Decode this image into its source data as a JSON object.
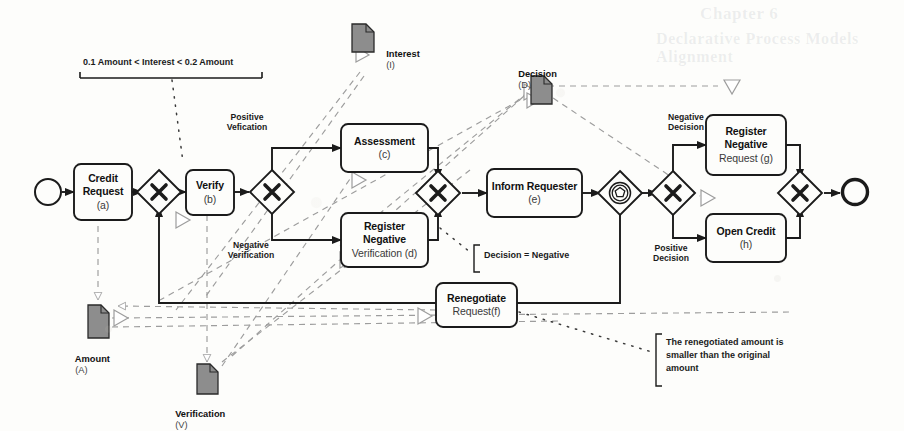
{
  "diagram": {
    "type": "BPMN process model",
    "title_visible": false
  },
  "events": {
    "start": {
      "name": "start-event",
      "shape": "circle-thin"
    },
    "end": {
      "name": "end-event",
      "shape": "circle-thick"
    }
  },
  "gateways": [
    {
      "id": "gw1",
      "symbol": "X",
      "kind": "exclusive",
      "name": "exclusive-gateway-merge-request"
    },
    {
      "id": "gw2",
      "symbol": "X",
      "kind": "exclusive",
      "name": "exclusive-gateway-verification-split"
    },
    {
      "id": "gw3",
      "symbol": "X",
      "kind": "exclusive",
      "name": "exclusive-gateway-verification-merge"
    },
    {
      "id": "gw4",
      "symbol": "O",
      "kind": "event-based",
      "name": "event-based-gateway-decision-wait"
    },
    {
      "id": "gw5",
      "symbol": "X",
      "kind": "exclusive",
      "name": "exclusive-gateway-decision-split"
    },
    {
      "id": "gw6",
      "symbol": "X",
      "kind": "exclusive",
      "name": "exclusive-gateway-final-merge"
    }
  ],
  "tasks": [
    {
      "id": "a",
      "lines": [
        "Credit",
        "Request"
      ],
      "code": "(a)",
      "name": "task-credit-request"
    },
    {
      "id": "b",
      "lines": [
        "Verify"
      ],
      "code": "(b)",
      "name": "task-verify"
    },
    {
      "id": "c",
      "lines": [
        "Assessment"
      ],
      "code": "(c)",
      "name": "task-assessment"
    },
    {
      "id": "d",
      "lines": [
        "Register",
        "Negative"
      ],
      "code": "Verification (d)",
      "name": "task-register-negative-verification"
    },
    {
      "id": "e",
      "lines": [
        "Inform Requester"
      ],
      "code": "(e)",
      "name": "task-inform-requester"
    },
    {
      "id": "f",
      "lines": [
        "Renegotiate"
      ],
      "code": "Request(f)",
      "name": "task-renegotiate-request"
    },
    {
      "id": "g",
      "lines": [
        "Register",
        "Negative"
      ],
      "code": "Request (g)",
      "name": "task-register-negative-request"
    },
    {
      "id": "h",
      "lines": [
        "Open Credit"
      ],
      "code": "(h)",
      "name": "task-open-credit"
    }
  ],
  "data_objects": [
    {
      "id": "I",
      "label": "Interest",
      "code": "(I)",
      "name": "data-object-interest"
    },
    {
      "id": "D",
      "label": "Decision",
      "code": "(D)",
      "name": "data-object-decision"
    },
    {
      "id": "A",
      "label": "Amount",
      "code": "(A)",
      "name": "data-object-amount"
    },
    {
      "id": "V",
      "label": "Verification",
      "code": "(V)",
      "name": "data-object-verification"
    }
  ],
  "flow_labels": [
    {
      "id": "pos-verif",
      "text": "Positive\nVefication",
      "name": "flow-label-positive-verification"
    },
    {
      "id": "neg-verif",
      "text": "Negative\nVerification",
      "name": "flow-label-negative-verification"
    },
    {
      "id": "neg-dec",
      "text": "Negative\nDecision",
      "name": "flow-label-negative-decision"
    },
    {
      "id": "pos-dec",
      "text": "Positive\nDecision",
      "name": "flow-label-positive-decision"
    }
  ],
  "annotations": [
    {
      "id": "an1",
      "text": "0.1 Amount < Interest < 0.2 Amount",
      "name": "annotation-interest-range"
    },
    {
      "id": "an2",
      "text": "Decision = Negative",
      "name": "annotation-decision-negative"
    },
    {
      "id": "an3",
      "text": "The renegotiated amount is\nsmaller than the original\namount",
      "name": "annotation-renegotiated-amount"
    }
  ],
  "colors": {
    "stroke": "#1b1b1b",
    "data_object_fill": "#8d8d8d",
    "data_association": "#9a9a9a",
    "background": "#fdfdfb",
    "text": "#1a1a1a"
  },
  "bleed_through": {
    "line1": "Chapter 6",
    "line2": "Declarative Process Models Alignment"
  }
}
